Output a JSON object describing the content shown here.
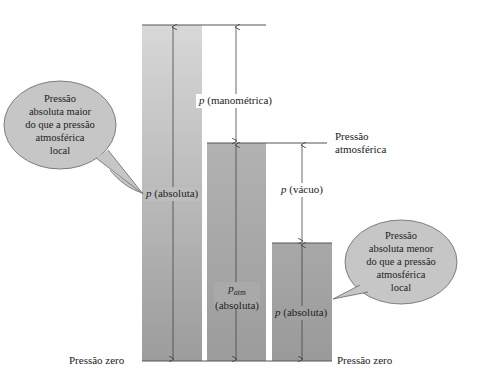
{
  "diagram": {
    "type": "pressure-reference-diagram",
    "labels": {
      "gauge": {
        "symbol": "p",
        "text": " (manométrica)"
      },
      "atmospheric_line": [
        "Pressão",
        "atmosférica"
      ],
      "vacuum": {
        "symbol": "p",
        "text": " (vácuo)"
      },
      "abs_high": {
        "symbol": "p",
        "text": " (absoluta)"
      },
      "abs_atm": {
        "symbol": "p",
        "subscript": "atm",
        "text": "(absoluta)"
      },
      "abs_low": {
        "symbol": "p",
        "text": " (absoluta)"
      },
      "zero_left": "Pressão zero",
      "zero_right": "Pressão zero"
    },
    "callouts": {
      "left": [
        "Pressão",
        "absoluta maior",
        "do que a pressão",
        "atmosférica",
        "local"
      ],
      "right": [
        "Pressão",
        "absoluta menor",
        "do que a pressão",
        "atmosférica",
        "local"
      ]
    },
    "colors": {
      "bar_light": "#d4d4d4",
      "bar_dark": "#9a9a9a",
      "bubble_fill": "#c4c4c4",
      "line": "#444444"
    }
  }
}
